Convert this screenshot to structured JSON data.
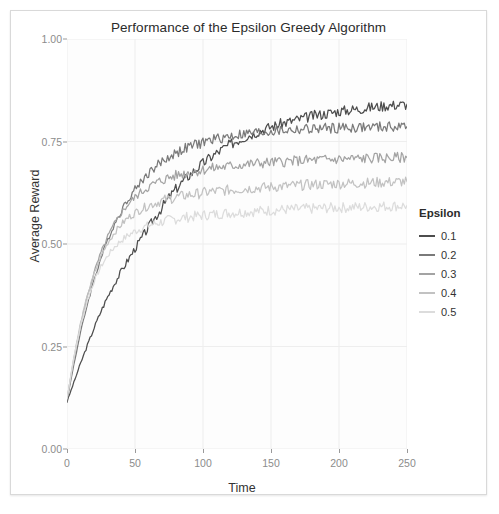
{
  "chart_data": {
    "type": "line",
    "title": "Performance of the Epsilon Greedy Algorithm",
    "xlabel": "Time",
    "ylabel": "Average Reward",
    "xlim": [
      0,
      250
    ],
    "ylim": [
      0.0,
      1.0
    ],
    "xticks": [
      "0",
      "50",
      "100",
      "150",
      "200",
      "250"
    ],
    "xtick_values": [
      0,
      50,
      100,
      150,
      200,
      250
    ],
    "yticks": [
      "0.00",
      "0.25",
      "0.50",
      "0.75",
      "1.00"
    ],
    "ytick_values": [
      0.0,
      0.25,
      0.5,
      0.75,
      1.0
    ],
    "grid": true,
    "legend_position": "right",
    "legend_title": "Epsilon",
    "panel_background": "#fdfdfd",
    "gridline_color": "#eeeeee",
    "series": [
      {
        "name": "0.1",
        "color": "#4d4d4d",
        "x": [
          0,
          5,
          10,
          15,
          20,
          25,
          30,
          35,
          40,
          45,
          50,
          55,
          60,
          65,
          70,
          75,
          80,
          85,
          90,
          95,
          100,
          105,
          110,
          115,
          120,
          125,
          130,
          135,
          140,
          145,
          150,
          155,
          160,
          165,
          170,
          175,
          180,
          185,
          190,
          195,
          200,
          205,
          210,
          215,
          220,
          225,
          230,
          235,
          240,
          245,
          250
        ],
        "values": [
          0.115,
          0.162,
          0.209,
          0.253,
          0.296,
          0.336,
          0.372,
          0.404,
          0.434,
          0.462,
          0.489,
          0.515,
          0.541,
          0.566,
          0.59,
          0.613,
          0.634,
          0.652,
          0.668,
          0.683,
          0.697,
          0.71,
          0.722,
          0.733,
          0.743,
          0.752,
          0.76,
          0.767,
          0.774,
          0.78,
          0.786,
          0.791,
          0.796,
          0.8,
          0.804,
          0.808,
          0.812,
          0.815,
          0.818,
          0.821,
          0.824,
          0.826,
          0.828,
          0.83,
          0.832,
          0.834,
          0.836,
          0.838,
          0.839,
          0.84,
          0.841
        ]
      },
      {
        "name": "0.2",
        "color": "#7a7a7a",
        "x": [
          0,
          5,
          10,
          15,
          20,
          25,
          30,
          35,
          40,
          45,
          50,
          55,
          60,
          65,
          70,
          75,
          80,
          85,
          90,
          95,
          100,
          105,
          110,
          115,
          120,
          125,
          130,
          135,
          140,
          145,
          150,
          155,
          160,
          165,
          170,
          175,
          180,
          185,
          190,
          195,
          200,
          205,
          210,
          215,
          220,
          225,
          230,
          235,
          240,
          245,
          250
        ],
        "values": [
          0.118,
          0.206,
          0.285,
          0.354,
          0.414,
          0.466,
          0.511,
          0.549,
          0.582,
          0.61,
          0.634,
          0.655,
          0.673,
          0.688,
          0.701,
          0.712,
          0.722,
          0.73,
          0.737,
          0.743,
          0.748,
          0.753,
          0.757,
          0.76,
          0.763,
          0.766,
          0.768,
          0.77,
          0.772,
          0.773,
          0.775,
          0.776,
          0.777,
          0.778,
          0.779,
          0.78,
          0.78,
          0.781,
          0.782,
          0.782,
          0.783,
          0.783,
          0.784,
          0.784,
          0.784,
          0.785,
          0.785,
          0.785,
          0.786,
          0.786,
          0.786
        ]
      },
      {
        "name": "0.3",
        "color": "#a3a3a3",
        "x": [
          0,
          5,
          10,
          15,
          20,
          25,
          30,
          35,
          40,
          45,
          50,
          55,
          60,
          65,
          70,
          75,
          80,
          85,
          90,
          95,
          100,
          105,
          110,
          115,
          120,
          125,
          130,
          135,
          140,
          145,
          150,
          155,
          160,
          165,
          170,
          175,
          180,
          185,
          190,
          195,
          200,
          205,
          210,
          215,
          220,
          225,
          230,
          235,
          240,
          245,
          250
        ],
        "values": [
          0.12,
          0.218,
          0.303,
          0.373,
          0.431,
          0.479,
          0.518,
          0.55,
          0.576,
          0.597,
          0.614,
          0.628,
          0.639,
          0.648,
          0.656,
          0.662,
          0.667,
          0.671,
          0.675,
          0.678,
          0.681,
          0.684,
          0.686,
          0.688,
          0.69,
          0.692,
          0.694,
          0.695,
          0.697,
          0.698,
          0.699,
          0.7,
          0.701,
          0.702,
          0.703,
          0.704,
          0.704,
          0.705,
          0.706,
          0.706,
          0.707,
          0.707,
          0.708,
          0.708,
          0.709,
          0.709,
          0.71,
          0.71,
          0.71,
          0.711,
          0.711
        ]
      },
      {
        "name": "0.4",
        "color": "#c2c2c2",
        "x": [
          0,
          5,
          10,
          15,
          20,
          25,
          30,
          35,
          40,
          45,
          50,
          55,
          60,
          65,
          70,
          75,
          80,
          85,
          90,
          95,
          100,
          105,
          110,
          115,
          120,
          125,
          130,
          135,
          140,
          145,
          150,
          155,
          160,
          165,
          170,
          175,
          180,
          185,
          190,
          195,
          200,
          205,
          210,
          215,
          220,
          225,
          230,
          235,
          240,
          245,
          250
        ],
        "values": [
          0.122,
          0.223,
          0.307,
          0.375,
          0.428,
          0.47,
          0.503,
          0.528,
          0.548,
          0.564,
          0.576,
          0.586,
          0.594,
          0.6,
          0.606,
          0.61,
          0.614,
          0.617,
          0.62,
          0.622,
          0.625,
          0.627,
          0.629,
          0.63,
          0.632,
          0.633,
          0.635,
          0.636,
          0.637,
          0.638,
          0.639,
          0.64,
          0.641,
          0.642,
          0.643,
          0.644,
          0.645,
          0.645,
          0.646,
          0.647,
          0.647,
          0.648,
          0.648,
          0.649,
          0.649,
          0.65,
          0.65,
          0.651,
          0.651,
          0.652,
          0.652
        ]
      },
      {
        "name": "0.5",
        "color": "#dcdcdc",
        "x": [
          0,
          5,
          10,
          15,
          20,
          25,
          30,
          35,
          40,
          45,
          50,
          55,
          60,
          65,
          70,
          75,
          80,
          85,
          90,
          95,
          100,
          105,
          110,
          115,
          120,
          125,
          130,
          135,
          140,
          145,
          150,
          155,
          160,
          165,
          170,
          175,
          180,
          185,
          190,
          195,
          200,
          205,
          210,
          215,
          220,
          225,
          230,
          235,
          240,
          245,
          250
        ],
        "values": [
          0.124,
          0.222,
          0.3,
          0.362,
          0.409,
          0.445,
          0.472,
          0.493,
          0.509,
          0.521,
          0.531,
          0.539,
          0.545,
          0.55,
          0.554,
          0.558,
          0.561,
          0.564,
          0.566,
          0.568,
          0.57,
          0.572,
          0.573,
          0.575,
          0.576,
          0.577,
          0.578,
          0.579,
          0.58,
          0.581,
          0.582,
          0.583,
          0.584,
          0.584,
          0.585,
          0.586,
          0.586,
          0.587,
          0.588,
          0.588,
          0.589,
          0.589,
          0.59,
          0.59,
          0.591,
          0.591,
          0.592,
          0.592,
          0.593,
          0.593,
          0.594
        ]
      }
    ]
  }
}
